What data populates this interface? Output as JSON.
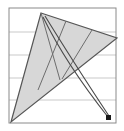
{
  "figure": {
    "canvas": {
      "width": 124,
      "height": 131,
      "background": "#ffffff"
    },
    "frame": {
      "name": "plot-frame",
      "x": 9,
      "y": 8,
      "width": 107,
      "height": 115,
      "stroke": "#8a8a8a",
      "stroke_width": 1,
      "fill": "none"
    },
    "gridlines": {
      "orientation": "horizontal",
      "stroke": "#c9c9c9",
      "stroke_width": 1,
      "y_values": [
        32,
        55,
        78,
        100
      ]
    },
    "triangle": {
      "name": "main-triangle",
      "fill": "#d7d7d7",
      "fill_opacity": 1,
      "stroke": "#565656",
      "stroke_width": 1.2,
      "vertices": [
        {
          "label": "apex",
          "x": 41,
          "y": 13
        },
        {
          "label": "right",
          "x": 117,
          "y": 38
        },
        {
          "label": "bottom-left",
          "x": 11,
          "y": 122
        }
      ]
    },
    "cevians": [
      {
        "name": "cevian-1",
        "from": {
          "x": 41,
          "y": 13
        },
        "to": {
          "x": 60,
          "y": 80
        },
        "stroke": "#6d6d6d",
        "stroke_width": 1
      },
      {
        "name": "cevian-2",
        "from": {
          "x": 66,
          "y": 21
        },
        "to": {
          "x": 38,
          "y": 90
        },
        "stroke": "#6d6d6d",
        "stroke_width": 1
      },
      {
        "name": "cevian-3",
        "from": {
          "x": 92,
          "y": 30
        },
        "to": {
          "x": 62,
          "y": 79
        },
        "stroke": "#6d6d6d",
        "stroke_width": 1
      }
    ],
    "curves": [
      {
        "name": "trajectory-curve-outer",
        "start": {
          "x": 45,
          "y": 16
        },
        "control": {
          "x": 72,
          "y": 60
        },
        "end": {
          "x": 109,
          "y": 116
        },
        "stroke": "#4a4a4a",
        "stroke_width": 1.1
      },
      {
        "name": "trajectory-curve-inner",
        "start": {
          "x": 43,
          "y": 17
        },
        "control": {
          "x": 66,
          "y": 64
        },
        "end": {
          "x": 108,
          "y": 117
        },
        "stroke": "#4a4a4a",
        "stroke_width": 1.1
      }
    ],
    "endpoint_marker": {
      "name": "trajectory-endpoint-marker",
      "shape": "square",
      "x": 106,
      "y": 115,
      "size": 5,
      "fill": "#1a1a1a"
    }
  }
}
